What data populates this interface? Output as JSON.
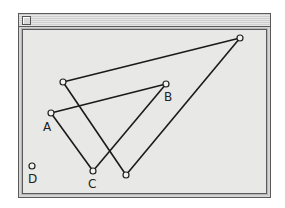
{
  "window": {
    "title": "",
    "close_box": "close-box-icon"
  },
  "colors": {
    "background": "#e8e8e6",
    "frame": "#5a5a5a",
    "line": "#1a1a1a",
    "point_fill": "#f2f2f0"
  },
  "points": [
    {
      "id": "A",
      "label": "A",
      "x": 51,
      "y": 113,
      "label_x": 43,
      "label_y": 131
    },
    {
      "id": "B",
      "label": "B",
      "x": 166,
      "y": 84,
      "label_x": 164,
      "label_y": 101
    },
    {
      "id": "C",
      "label": "C",
      "x": 93,
      "y": 171,
      "label_x": 88,
      "label_y": 188
    },
    {
      "id": "D",
      "label": "D",
      "x": 32,
      "y": 166,
      "label_x": 28,
      "label_y": 183
    },
    {
      "id": "P1",
      "label": "",
      "x": 63,
      "y": 82
    },
    {
      "id": "P2",
      "label": "",
      "x": 240,
      "y": 38
    },
    {
      "id": "P3",
      "label": "",
      "x": 126,
      "y": 175
    }
  ],
  "segments": [
    {
      "from": "A",
      "to": "B"
    },
    {
      "from": "B",
      "to": "C"
    },
    {
      "from": "C",
      "to": "A"
    },
    {
      "from": "P1",
      "to": "P2"
    },
    {
      "from": "P2",
      "to": "P3"
    },
    {
      "from": "P3",
      "to": "P1"
    }
  ],
  "labels": {
    "A": "A",
    "B": "B",
    "C": "C",
    "D": "D"
  }
}
